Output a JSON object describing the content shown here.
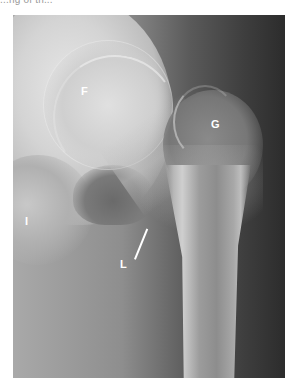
{
  "caption_fragment": "...ng of th...",
  "figure": {
    "type": "radiograph",
    "colors": {
      "background": "#ffffff",
      "bone_bright": "#e0e0e0",
      "soft_tissue": "#8e8e8e",
      "dark_field": "#2c2c2c",
      "label": "#ffffff"
    },
    "labels": [
      {
        "id": "F",
        "text": "F",
        "x": 81,
        "y": 86
      },
      {
        "id": "G",
        "text": "G",
        "x": 211,
        "y": 119
      },
      {
        "id": "I",
        "text": "I",
        "x": 25,
        "y": 216
      },
      {
        "id": "L",
        "text": "L",
        "x": 120,
        "y": 259
      }
    ],
    "pointer": {
      "from_label": "L",
      "x1": 134,
      "y1": 257,
      "x2": 146,
      "y2": 227
    }
  }
}
